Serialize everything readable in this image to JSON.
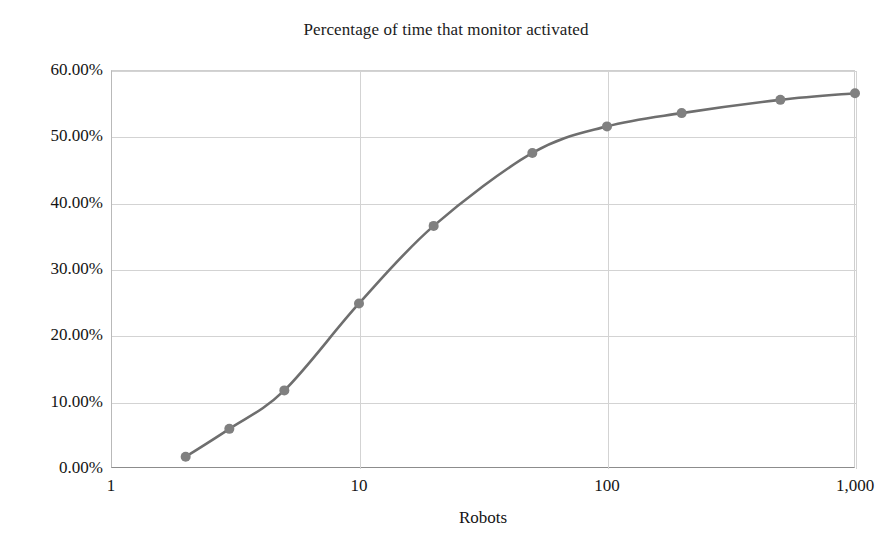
{
  "chart_data": {
    "type": "line",
    "title": "Percentage of time that monitor activated",
    "xlabel": "Robots",
    "ylabel": "",
    "xscale": "log",
    "xlim": [
      1,
      1000
    ],
    "ylim": [
      0,
      0.6
    ],
    "grid": true,
    "legend": false,
    "line_color": "#6e6e6e",
    "marker": "circle",
    "marker_color": "#808080",
    "x": [
      2,
      3,
      5,
      10,
      20,
      50,
      100,
      200,
      500,
      1000
    ],
    "values": [
      0.017,
      0.059,
      0.117,
      0.248,
      0.365,
      0.475,
      0.515,
      0.535,
      0.555,
      0.565
    ],
    "point_labels": [
      "1.70%",
      "5.90%",
      "11.70%",
      "24.80%",
      "36.50%",
      "47.50%",
      "51.50%",
      "53.50%",
      "55.50%",
      "56.50%"
    ],
    "xticks": [
      1,
      10,
      100,
      1000
    ],
    "xticklabels": [
      "1",
      "10",
      "100",
      "1,000"
    ],
    "yticks": [
      0.0,
      0.1,
      0.2,
      0.3,
      0.4,
      0.5,
      0.6
    ],
    "yticklabels": [
      "0.00%",
      "10.00%",
      "20.00%",
      "30.00%",
      "40.00%",
      "50.00%",
      "60.00%"
    ]
  }
}
